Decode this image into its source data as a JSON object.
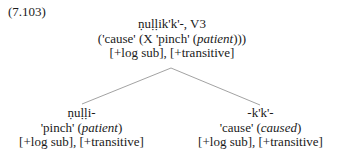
{
  "example_number": "(7.103)",
  "root": {
    "form": "ṇuḷḷik'k'-, V3",
    "gloss_pre": "('cause' (X 'pinch' (",
    "gloss_italic": "patient",
    "gloss_post": ")))",
    "features": "[+log sub], [+transitive]"
  },
  "children": [
    {
      "form": "ṇuḷḷi-",
      "gloss_pre": "'pinch' (",
      "gloss_italic": "patient",
      "gloss_post": ")",
      "features": "[+log sub], [+transitive]"
    },
    {
      "form": "-k'k'-",
      "gloss_pre": "'cause' (",
      "gloss_italic": "caused",
      "gloss_post": ")",
      "features": "[+log sub], [+transitive]"
    }
  ],
  "colors": {
    "text": "#1a1a1a",
    "branch": "#8a8a8a"
  }
}
